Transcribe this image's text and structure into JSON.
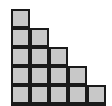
{
  "figure": {
    "name": "staircase-step-figure",
    "shape_type": "staircase",
    "total_squares": 20,
    "rows_count": 6,
    "columns_count": 5,
    "background_color": "#ffffff",
    "cell_fill_color": "#c8c8c8",
    "cell_stroke_color": "#1a1a1a",
    "cell_stroke_width": 2,
    "cell_size_px": 19,
    "origin_x_px": 11,
    "origin_y_px": 9
  },
  "chart_data": {
    "type": "bar",
    "title": "",
    "xlabel": "",
    "ylabel": "",
    "categories": [
      "1",
      "2",
      "3",
      "4",
      "5"
    ],
    "values": [
      6,
      5,
      4,
      3,
      2
    ],
    "row_counts": [
      1,
      2,
      3,
      4,
      5,
      5
    ],
    "ylim": [
      0,
      6
    ],
    "grid": true,
    "legend": "none"
  },
  "cells": [
    {
      "row": 0,
      "col": 0
    },
    {
      "row": 1,
      "col": 0
    },
    {
      "row": 1,
      "col": 1
    },
    {
      "row": 2,
      "col": 0
    },
    {
      "row": 2,
      "col": 1
    },
    {
      "row": 2,
      "col": 2
    },
    {
      "row": 3,
      "col": 0
    },
    {
      "row": 3,
      "col": 1
    },
    {
      "row": 3,
      "col": 2
    },
    {
      "row": 3,
      "col": 3
    },
    {
      "row": 4,
      "col": 0
    },
    {
      "row": 4,
      "col": 1
    },
    {
      "row": 4,
      "col": 2
    },
    {
      "row": 4,
      "col": 3
    },
    {
      "row": 4,
      "col": 4
    },
    {
      "row": 5,
      "col": 0
    },
    {
      "row": 5,
      "col": 1
    },
    {
      "row": 5,
      "col": 2
    },
    {
      "row": 5,
      "col": 3
    },
    {
      "row": 5,
      "col": 4
    }
  ]
}
